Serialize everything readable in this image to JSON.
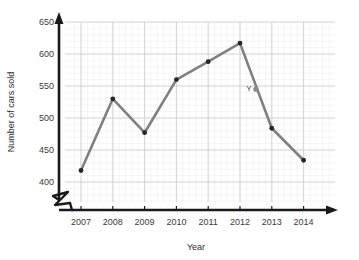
{
  "chart_data": {
    "type": "line",
    "title": "",
    "xlabel": "Year",
    "ylabel": "Number of cars sold",
    "categories": [
      "2007",
      "2008",
      "2009",
      "2010",
      "2011",
      "2012",
      "2013",
      "2014"
    ],
    "x": [
      2007,
      2008,
      2009,
      2010,
      2011,
      2012,
      2013,
      2014
    ],
    "values": [
      418,
      530,
      477,
      560,
      588,
      617,
      484,
      434
    ],
    "series": [
      {
        "name": "Number of cars sold",
        "values": [
          418,
          530,
          477,
          560,
          588,
          617,
          484,
          434
        ]
      }
    ],
    "ylim": [
      390,
      655
    ],
    "xlim": [
      2006.5,
      2014.6
    ],
    "ytick_labels": [
      "400",
      "450",
      "500",
      "550",
      "600",
      "650"
    ],
    "ytick_values": [
      400,
      450,
      500,
      550,
      600,
      650
    ],
    "xtick_labels": [
      "2007",
      "2008",
      "2009",
      "2010",
      "2011",
      "2012",
      "2013",
      "2014"
    ],
    "grid": "major and minor",
    "minor_subdivisions": 5,
    "legend": "none",
    "y_axis_break": true,
    "annotations": [
      {
        "label": "Y",
        "x": 2012.5,
        "y": 545,
        "marker": "point-on-segment"
      }
    ],
    "colors": {
      "line": "#808080",
      "marker": "#262626",
      "annotation_marker": "#8c8c8c",
      "major_grid": "#cccccc",
      "minor_grid": "#ededed",
      "axis": "#1a1a1a",
      "text": "#3a3a3a",
      "background": "#ffffff"
    }
  },
  "axes": {
    "y_title": "Number of cars sold",
    "x_title": "Year",
    "y_ticks": [
      "650",
      "600",
      "550",
      "500",
      "450",
      "400"
    ],
    "x_ticks": [
      "2007",
      "2008",
      "2009",
      "2010",
      "2011",
      "2012",
      "2013",
      "2014"
    ]
  },
  "annotation": {
    "label": "Y"
  }
}
